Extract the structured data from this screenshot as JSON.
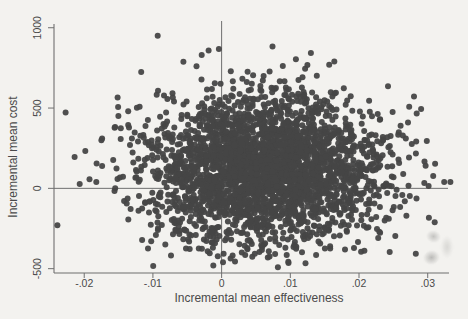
{
  "colors": {
    "background": "#f3f2ef",
    "axis": "#6f6f6f",
    "reference_line": "#6f6f6f",
    "text": "#4a4a4a",
    "point": "#464646"
  },
  "chart_data": {
    "type": "scatter",
    "title": "",
    "xlabel": "Incremental mean effectiveness",
    "ylabel": "Incremental mean cost",
    "xlim": [
      -0.0244,
      0.0331
    ],
    "ylim": [
      -527,
      1042
    ],
    "grid": false,
    "legend": "none",
    "x_ticks": {
      "values": [
        -0.02,
        -0.01,
        0,
        0.01,
        0.02,
        0.03
      ],
      "labels": [
        "-.02",
        "-.01",
        "0",
        ".01",
        ".02",
        ".03"
      ]
    },
    "y_ticks": {
      "values": [
        -500,
        0,
        500,
        1000
      ],
      "labels": [
        "-500",
        "0",
        "500",
        "1000"
      ]
    },
    "reference_lines": {
      "vertical_at_x": 0,
      "horizontal_at_y": 0
    },
    "point_style": {
      "color": "#464646",
      "radius_px": 3,
      "opacity": 0.95
    },
    "cloud": {
      "distribution": "bivariate_normal",
      "n_points": 3000,
      "mean_x": 0.006,
      "mean_y": 120,
      "std_x": 0.0085,
      "std_y": 225,
      "correlation": 0,
      "seed": 42
    },
    "notable_points": [
      [
        -0.0093,
        950
      ],
      [
        -0.0029,
        831
      ],
      [
        -0.0019,
        858
      ],
      [
        -0.0004,
        867
      ],
      [
        0.0074,
        883
      ],
      [
        0.013,
        842
      ],
      [
        0.0164,
        790
      ],
      [
        0.028,
        571
      ],
      [
        0.0273,
        508
      ],
      [
        -0.0136,
        394
      ],
      [
        -0.0175,
        300
      ],
      [
        -0.0214,
        196
      ],
      [
        -0.0182,
        154
      ],
      [
        -0.0153,
        123
      ],
      [
        -0.0148,
        67
      ],
      [
        -0.0156,
        -17
      ],
      [
        -0.0239,
        -230
      ],
      [
        -0.0082,
        -350
      ],
      [
        0.0002,
        -460
      ],
      [
        0.0089,
        -313
      ],
      [
        0.0172,
        -294
      ],
      [
        0.0263,
        -42
      ],
      [
        0.0274,
        -48
      ],
      [
        0.0295,
        33
      ],
      [
        0.0308,
        77
      ],
      [
        0.0324,
        39
      ],
      [
        0.0333,
        39
      ]
    ]
  }
}
